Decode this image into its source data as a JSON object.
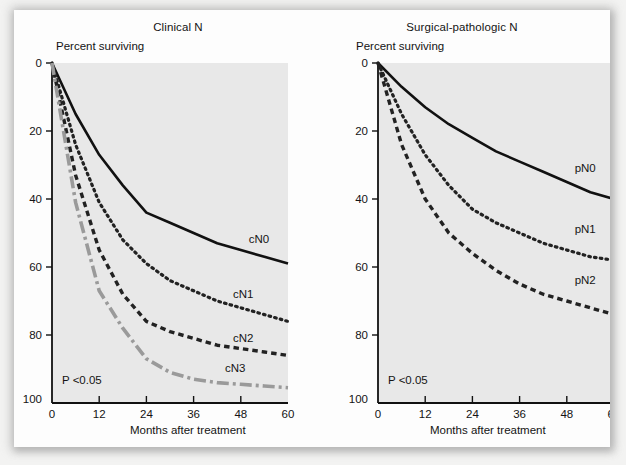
{
  "figure": {
    "background_color": "#f3f3f2",
    "card_color": "#fdfdfd",
    "plot_area_color": "#e8e8e8",
    "axis_color": "#111111"
  },
  "panels": [
    {
      "id": "clinical",
      "title": "Clinical N",
      "y_axis_title": "Percent surviving",
      "x_axis_title": "Months after treatment",
      "p_value": "P <0.05",
      "y_ticks": [
        "100",
        "80",
        "60",
        "40",
        "20",
        "0"
      ],
      "x_ticks": [
        "0",
        "12",
        "24",
        "36",
        "48",
        "60"
      ]
    },
    {
      "id": "surgical",
      "title": "Surgical-pathologic N",
      "y_axis_title": "Percent surviving",
      "x_axis_title": "Months after treatment",
      "p_value": "P <0.05",
      "y_ticks": [
        "100",
        "80",
        "60",
        "40",
        "20",
        "0"
      ],
      "x_ticks": [
        "0",
        "12",
        "24",
        "36",
        "48",
        "60"
      ]
    }
  ],
  "chart_data": [
    {
      "type": "line",
      "title": "Clinical N",
      "xlabel": "Months after treatment",
      "ylabel": "Percent surviving",
      "xlim": [
        0,
        60
      ],
      "ylim": [
        0,
        100
      ],
      "xticks": [
        0,
        12,
        24,
        36,
        48,
        60
      ],
      "yticks": [
        0,
        20,
        40,
        60,
        80,
        100
      ],
      "grid": false,
      "legend": "inline-right-of-curve",
      "annotation": "P <0.05",
      "x": [
        0,
        6,
        12,
        18,
        24,
        30,
        36,
        42,
        48,
        54,
        60
      ],
      "series": [
        {
          "name": "cN0",
          "style": "solid",
          "color": "#111111",
          "label_x": 50,
          "label_y": 47,
          "values": [
            100,
            85,
            73,
            64,
            56,
            53,
            50,
            47,
            45,
            43,
            41
          ]
        },
        {
          "name": "cN1",
          "style": "dotted",
          "color": "#222222",
          "label_x": 46,
          "label_y": 31,
          "values": [
            100,
            76,
            59,
            48,
            41,
            36,
            33,
            30,
            28,
            26,
            24
          ]
        },
        {
          "name": "cN2",
          "style": "dashed",
          "color": "#222222",
          "label_x": 46,
          "label_y": 18,
          "values": [
            100,
            67,
            45,
            32,
            24,
            21,
            19,
            17,
            16,
            15,
            14
          ]
        },
        {
          "name": "cN3",
          "style": "dash-dot",
          "color": "#9a9a9a",
          "label_x": 44,
          "label_y": 9,
          "values": [
            100,
            59,
            33,
            22,
            13,
            9,
            7,
            6,
            5.5,
            5,
            4.5
          ]
        }
      ]
    },
    {
      "type": "line",
      "title": "Surgical-pathologic N",
      "xlabel": "Months after treatment",
      "ylabel": "Percent surviving",
      "xlim": [
        0,
        60
      ],
      "ylim": [
        0,
        100
      ],
      "xticks": [
        0,
        12,
        24,
        36,
        48,
        60
      ],
      "yticks": [
        0,
        20,
        40,
        60,
        80,
        100
      ],
      "grid": false,
      "legend": "inline-right-of-curve",
      "annotation": "P <0.05",
      "x": [
        0,
        6,
        12,
        18,
        24,
        30,
        36,
        42,
        48,
        54,
        60
      ],
      "series": [
        {
          "name": "pN0",
          "style": "solid",
          "color": "#111111",
          "label_x": 50,
          "label_y": 68,
          "values": [
            100,
            93,
            87,
            82,
            78,
            74,
            71,
            68,
            65,
            62,
            60
          ]
        },
        {
          "name": "pN1",
          "style": "dotted",
          "color": "#222222",
          "label_x": 50,
          "label_y": 50,
          "values": [
            100,
            85,
            73,
            64,
            57,
            53,
            50,
            47,
            45,
            43,
            42
          ]
        },
        {
          "name": "pN2",
          "style": "dashed",
          "color": "#222222",
          "label_x": 50,
          "label_y": 35,
          "values": [
            100,
            76,
            60,
            50,
            44,
            39,
            35,
            32,
            30,
            28,
            26
          ]
        }
      ]
    }
  ]
}
